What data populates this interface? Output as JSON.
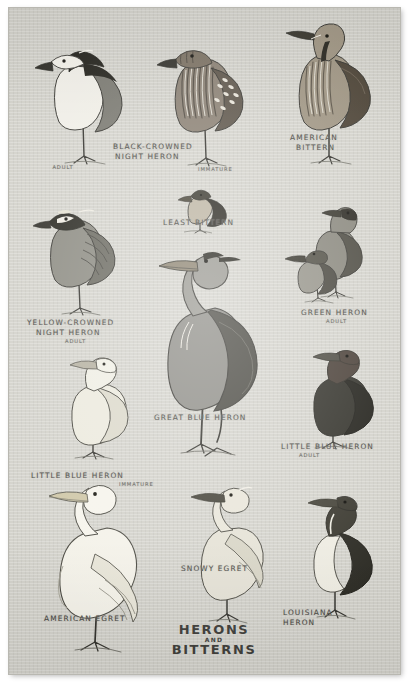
{
  "plate": {
    "title": {
      "line1": "HERONS",
      "line2": "AND",
      "line3": "BITTERNS"
    },
    "paper_color": "#d3d2cb",
    "ink_color": "#4c4b47"
  },
  "birds": [
    {
      "id": "black-crowned-night-heron-adult",
      "name": "BLACK-CROWNED",
      "name2": "NIGHT HERON",
      "stage": "ADULT"
    },
    {
      "id": "black-crowned-night-heron-immature",
      "name": "",
      "name2": "",
      "stage": "IMMATURE"
    },
    {
      "id": "american-bittern",
      "name": "AMERICAN",
      "name2": "BITTERN",
      "stage": ""
    },
    {
      "id": "least-bittern",
      "name": "LEAST  BITTERN",
      "name2": "",
      "stage": ""
    },
    {
      "id": "yellow-crowned-night-heron",
      "name": "YELLOW-CROWNED",
      "name2": "NIGHT HERON",
      "stage": "ADULT"
    },
    {
      "id": "green-heron",
      "name": "GREEN HERON",
      "name2": "",
      "stage": "ADULT"
    },
    {
      "id": "great-blue-heron",
      "name": "GREAT BLUE  HERON",
      "name2": "",
      "stage": ""
    },
    {
      "id": "little-blue-heron-adult",
      "name": "LITTLE BLUE HERON",
      "name2": "",
      "stage": "ADULT"
    },
    {
      "id": "little-blue-heron-immature",
      "name": "LITTLE BLUE HERON",
      "name2": "",
      "stage": "IMMATURE"
    },
    {
      "id": "american-egret",
      "name": "AMERICAN  EGRET",
      "name2": "",
      "stage": ""
    },
    {
      "id": "snowy-egret",
      "name": "SNOWY  EGRET",
      "name2": "",
      "stage": ""
    },
    {
      "id": "louisiana-heron",
      "name": "LOUISIANA",
      "name2": "HERON",
      "stage": ""
    }
  ]
}
